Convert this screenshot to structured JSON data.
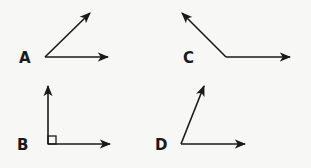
{
  "stroke_color": "#1a1a1a",
  "background_color": "#f7f7f5",
  "angles": [
    {
      "label": "A",
      "type": "acute",
      "vertex": [
        45,
        57
      ],
      "ray1_end": [
        90,
        13
      ],
      "ray2_end": [
        108,
        57
      ],
      "right_angle_marker": false
    },
    {
      "label": "B",
      "type": "right",
      "vertex": [
        48,
        144
      ],
      "ray1_end": [
        48,
        86
      ],
      "ray2_end": [
        110,
        144
      ],
      "right_angle_marker": true
    },
    {
      "label": "C",
      "type": "obtuse",
      "vertex": [
        226,
        57
      ],
      "ray1_end": [
        182,
        13
      ],
      "ray2_end": [
        290,
        57
      ],
      "right_angle_marker": false
    },
    {
      "label": "D",
      "type": "acute",
      "vertex": [
        181,
        144
      ],
      "ray1_end": [
        204,
        86
      ],
      "ray2_end": [
        245,
        144
      ],
      "right_angle_marker": false
    }
  ]
}
